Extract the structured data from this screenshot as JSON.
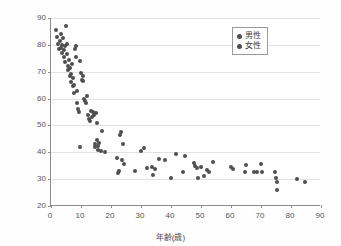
{
  "chart_data": {
    "type": "scatter",
    "title": "",
    "xlabel": "年齢(歳)",
    "ylabel": "エネルギー消費量(kcal/kg体重/日)",
    "xlim": [
      0,
      90
    ],
    "ylim": [
      20,
      90
    ],
    "xticks": [
      0,
      10,
      20,
      30,
      40,
      50,
      60,
      70,
      80,
      90
    ],
    "yticks": [
      20,
      30,
      40,
      50,
      60,
      70,
      80,
      90
    ],
    "grid": "horizontal",
    "legend_position": "upper-right",
    "marker_color": "#4f4f4f",
    "series": [
      {
        "name": "男性",
        "points": [
          [
            1.5,
            85.5
          ],
          [
            2.0,
            83.0
          ],
          [
            2.3,
            80.5
          ],
          [
            2.6,
            78.5
          ],
          [
            3.0,
            81.5
          ],
          [
            3.2,
            79.0
          ],
          [
            3.4,
            84.0
          ],
          [
            3.6,
            77.0
          ],
          [
            3.8,
            80.0
          ],
          [
            4.0,
            82.5
          ],
          [
            4.2,
            78.0
          ],
          [
            4.4,
            75.5
          ],
          [
            4.6,
            79.5
          ],
          [
            4.8,
            73.5
          ],
          [
            5.0,
            87.0
          ],
          [
            5.2,
            80.5
          ],
          [
            5.4,
            76.5
          ],
          [
            5.6,
            72.0
          ],
          [
            5.8,
            70.5
          ],
          [
            6.0,
            74.5
          ],
          [
            6.2,
            68.5
          ],
          [
            6.4,
            71.5
          ],
          [
            6.6,
            66.0
          ],
          [
            6.8,
            69.0
          ],
          [
            7.0,
            73.0
          ],
          [
            7.2,
            64.5
          ],
          [
            7.4,
            67.5
          ],
          [
            7.6,
            62.0
          ],
          [
            7.8,
            65.0
          ],
          [
            8.0,
            78.5
          ],
          [
            8.2,
            79.5
          ],
          [
            8.4,
            75.5
          ],
          [
            8.6,
            63.0
          ],
          [
            8.8,
            58.5
          ],
          [
            9.0,
            56.0
          ],
          [
            9.2,
            55.0
          ],
          [
            9.5,
            42.0
          ],
          [
            9.8,
            74.0
          ],
          [
            10.0,
            69.5
          ],
          [
            10.2,
            67.0
          ],
          [
            10.5,
            68.5
          ],
          [
            10.8,
            66.5
          ],
          [
            11.0,
            60.0
          ],
          [
            11.3,
            59.0
          ],
          [
            11.6,
            58.5
          ],
          [
            12.0,
            61.0
          ],
          [
            12.4,
            54.0
          ],
          [
            12.8,
            52.5
          ],
          [
            13.0,
            51.5
          ],
          [
            13.4,
            55.5
          ],
          [
            13.8,
            53.0
          ],
          [
            14.0,
            55.0
          ],
          [
            14.3,
            54.0
          ],
          [
            14.6,
            43.0
          ],
          [
            14.8,
            42.0
          ],
          [
            15.0,
            54.5
          ],
          [
            15.2,
            51.0
          ],
          [
            15.4,
            44.5
          ],
          [
            15.6,
            42.5
          ],
          [
            15.8,
            41.0
          ],
          [
            16.0,
            43.5
          ],
          [
            16.5,
            40.5
          ],
          [
            17.0,
            48.0
          ],
          [
            18.0,
            40.2
          ],
          [
            22.0,
            38.0
          ],
          [
            22.3,
            32.2
          ],
          [
            22.6,
            33.0
          ],
          [
            23.0,
            46.5
          ],
          [
            23.3,
            47.5
          ],
          [
            23.6,
            37.0
          ],
          [
            24.0,
            43.0
          ],
          [
            24.4,
            35.5
          ],
          [
            28.0,
            33.0
          ],
          [
            30.0,
            40.5
          ],
          [
            31.0,
            41.5
          ],
          [
            32.0,
            34.0
          ],
          [
            33.5,
            34.5
          ],
          [
            34.0,
            31.5
          ],
          [
            34.5,
            33.8
          ],
          [
            36.0,
            37.5
          ],
          [
            38.0,
            37.0
          ],
          [
            40.0,
            30.5
          ],
          [
            41.5,
            39.5
          ],
          [
            44.0,
            32.5
          ],
          [
            44.5,
            38.5
          ],
          [
            47.5,
            36.0
          ],
          [
            48.0,
            35.0
          ],
          [
            48.5,
            34.0
          ],
          [
            49.0,
            30.5
          ],
          [
            50.0,
            34.5
          ],
          [
            51.0,
            31.0
          ],
          [
            52.0,
            33.5
          ],
          [
            52.5,
            32.8
          ],
          [
            54.0,
            36.5
          ],
          [
            60.0,
            34.5
          ],
          [
            60.5,
            33.8
          ],
          [
            64.5,
            32.5
          ],
          [
            65.0,
            35.2
          ],
          [
            67.5,
            32.5
          ],
          [
            68.5,
            32.6
          ],
          [
            70.0,
            35.8
          ],
          [
            70.2,
            32.5
          ],
          [
            74.5,
            32.8
          ],
          [
            75.0,
            30.5
          ],
          [
            75.2,
            29.0
          ],
          [
            75.4,
            26.0
          ],
          [
            82.0,
            30.2
          ],
          [
            84.5,
            28.8
          ]
        ]
      },
      {
        "name": "女性",
        "points": []
      }
    ]
  },
  "legend": {
    "items": [
      {
        "label": "男性"
      },
      {
        "label": "女性"
      }
    ]
  },
  "axes": {
    "x": {
      "title": "年齢(歳)",
      "ticks": [
        "0",
        "10",
        "20",
        "30",
        "40",
        "50",
        "60",
        "70",
        "80",
        "90"
      ]
    },
    "y": {
      "title": "エネルギー消費量(kcal/kg体重/日)",
      "ticks": [
        "20",
        "30",
        "40",
        "50",
        "60",
        "70",
        "80",
        "90"
      ]
    }
  }
}
